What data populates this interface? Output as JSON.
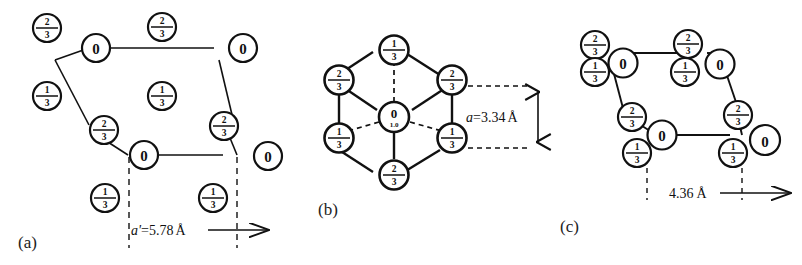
{
  "figure": {
    "title": "",
    "panels": [
      {
        "id": "a",
        "label": "(a)",
        "dimension_label": "a'=5.78 Å",
        "dimension_value": 5.78,
        "dimension_unit": "Å",
        "dimension_symbol": "a'",
        "atoms": [
          {
            "label": "2/3",
            "type": "fraction",
            "num": "2",
            "den": "3"
          },
          {
            "label": "2/3",
            "type": "fraction",
            "num": "2",
            "den": "3"
          },
          {
            "label": "0",
            "type": "integer"
          },
          {
            "label": "0",
            "type": "integer"
          },
          {
            "label": "1/3",
            "type": "fraction",
            "num": "1",
            "den": "3"
          },
          {
            "label": "1/3",
            "type": "fraction",
            "num": "1",
            "den": "3"
          },
          {
            "label": "2/3",
            "type": "fraction",
            "num": "2",
            "den": "3"
          },
          {
            "label": "2/3",
            "type": "fraction",
            "num": "2",
            "den": "3"
          },
          {
            "label": "0",
            "type": "integer"
          },
          {
            "label": "0",
            "type": "integer"
          },
          {
            "label": "1/3",
            "type": "fraction",
            "num": "1",
            "den": "3"
          },
          {
            "label": "1/3",
            "type": "fraction",
            "num": "1",
            "den": "3"
          }
        ]
      },
      {
        "id": "b",
        "label": "(b)",
        "dimension_label": "a=3.34 Å",
        "dimension_value": 3.34,
        "dimension_unit": "Å",
        "dimension_symbol": "a",
        "atoms": [
          {
            "label": "1/3",
            "type": "fraction",
            "num": "1",
            "den": "3"
          },
          {
            "label": "2/3",
            "type": "fraction",
            "num": "2",
            "den": "3"
          },
          {
            "label": "2/3",
            "type": "fraction",
            "num": "2",
            "den": "3"
          },
          {
            "label": "0",
            "type": "integer",
            "sub": "1.0"
          },
          {
            "label": "1/3",
            "type": "fraction",
            "num": "1",
            "den": "3"
          },
          {
            "label": "1/3",
            "type": "fraction",
            "num": "1",
            "den": "3"
          },
          {
            "label": "2/3",
            "type": "fraction",
            "num": "2",
            "den": "3"
          }
        ]
      },
      {
        "id": "c",
        "label": "(c)",
        "dimension_label": "4.36 Å",
        "dimension_value": 4.36,
        "dimension_unit": "Å",
        "dimension_symbol": "",
        "atoms": [
          {
            "label": "2/3",
            "type": "fraction",
            "num": "2",
            "den": "3"
          },
          {
            "label": "2/3",
            "type": "fraction",
            "num": "2",
            "den": "3"
          },
          {
            "label": "0",
            "type": "integer"
          },
          {
            "label": "0",
            "type": "integer"
          },
          {
            "label": "1/3",
            "type": "fraction",
            "num": "1",
            "den": "3"
          },
          {
            "label": "1/3",
            "type": "fraction",
            "num": "1",
            "den": "3"
          },
          {
            "label": "2/3",
            "type": "fraction",
            "num": "2",
            "den": "3"
          },
          {
            "label": "2/3",
            "type": "fraction",
            "num": "2",
            "den": "3"
          },
          {
            "label": "0",
            "type": "integer"
          },
          {
            "label": "0",
            "type": "integer"
          },
          {
            "label": "1/3",
            "type": "fraction",
            "num": "1",
            "den": "3"
          },
          {
            "label": "1/3",
            "type": "fraction",
            "num": "1",
            "den": "3"
          }
        ]
      }
    ],
    "colors": {
      "ink": "#111111",
      "background": "#ffffff"
    }
  },
  "atoms_a": {
    "a1": "2",
    "a1d": "3",
    "a2": "2",
    "a2d": "3",
    "a3": "0",
    "a4": "0",
    "a5": "1",
    "a5d": "3",
    "a6": "1",
    "a6d": "3",
    "a7": "2",
    "a7d": "3",
    "a8": "2",
    "a8d": "3",
    "a9": "0",
    "a10": "0",
    "a11": "1",
    "a11d": "3",
    "a12": "1",
    "a12d": "3"
  },
  "atoms_b": {
    "b_top": "1",
    "b_topd": "3",
    "b_ul": "2",
    "b_uld": "3",
    "b_ur": "2",
    "b_urd": "3",
    "b_center": "0",
    "b_center_sub": "1.0",
    "b_ll": "1",
    "b_lld": "3",
    "b_lr": "1",
    "b_lrd": "3",
    "b_bottom": "2",
    "b_bottomd": "3"
  },
  "atoms_c": {
    "c1": "2",
    "c1d": "3",
    "c2": "2",
    "c2d": "3",
    "c3": "0",
    "c4": "0",
    "c5": "1",
    "c5d": "3",
    "c6": "1",
    "c6d": "3",
    "c7": "2",
    "c7d": "3",
    "c8": "2",
    "c8d": "3",
    "c9": "0",
    "c10": "0",
    "c11": "1",
    "c11d": "3",
    "c12": "1",
    "c12d": "3"
  },
  "labels": {
    "panel_a": "(a)",
    "panel_b": "(b)",
    "panel_c": "(c)",
    "dim_a_sym": "a'",
    "dim_a_eq": "=5.78",
    "dim_a_unit": "Å",
    "dim_b_sym": "a",
    "dim_b_eq": "=3.34",
    "dim_b_unit": "Å",
    "dim_c_val": "4.36",
    "dim_c_unit": "Å"
  }
}
